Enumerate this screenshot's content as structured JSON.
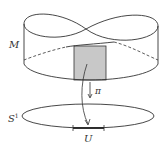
{
  "diagram": {
    "labels": {
      "total_space": "M",
      "projection": "π",
      "base_space": "S",
      "base_space_sup": "1",
      "open_set": "U"
    },
    "colors": {
      "stroke": "#333333",
      "shade": "#c8c8c8",
      "background": "#ffffff"
    }
  }
}
